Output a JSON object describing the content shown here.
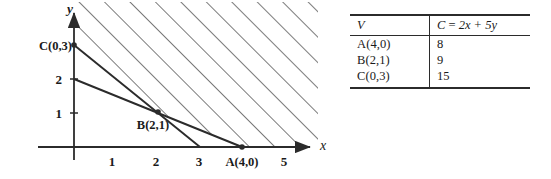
{
  "figure": {
    "type": "linear-programming-feasible-region",
    "graph": {
      "x_axis_label": "x",
      "y_axis_label": "y",
      "x_tick_labels": [
        "1",
        "2",
        "3",
        "5"
      ],
      "y_tick_labels": [
        "2",
        "1"
      ],
      "point_labels": {
        "a": "A(4,0)",
        "b": "B(2,1)",
        "c": "C(0,3)"
      },
      "points": [
        {
          "name": "A",
          "label": "A(4,0)",
          "x": 4,
          "y": 0
        },
        {
          "name": "B",
          "label": "B(2,1)",
          "x": 2,
          "y": 1
        },
        {
          "name": "C",
          "label": "C(0,3)",
          "x": 0,
          "y": 3
        }
      ],
      "lines": [
        {
          "name": "constraint-line-1",
          "from": [
            0,
            3
          ],
          "to": [
            3,
            0
          ]
        },
        {
          "name": "constraint-line-2",
          "from": [
            0,
            2
          ],
          "to": [
            4,
            0
          ]
        }
      ],
      "axis_ranges": {
        "x": [
          0,
          5.6
        ],
        "y": [
          0,
          3.9
        ]
      },
      "shading": {
        "style": "diagonal-hatch",
        "direction": "45-up-right",
        "region": "above-both-lines"
      },
      "colors": {
        "ink": "#2b2b2b",
        "hatch": "#3a3a3a",
        "background": "#ffffff"
      }
    },
    "table": {
      "headers": {
        "vertex": "V",
        "objective_prefix": "C",
        "objective_equals": "=",
        "objective_expr": "2x + 5y",
        "objective_full": "C = 2x + 5y"
      },
      "rows": [
        {
          "vertex": "A(4,0)",
          "value": "8"
        },
        {
          "vertex": "B(2,1)",
          "value": "9"
        },
        {
          "vertex": "C(0,3)",
          "value": "15"
        }
      ]
    }
  }
}
